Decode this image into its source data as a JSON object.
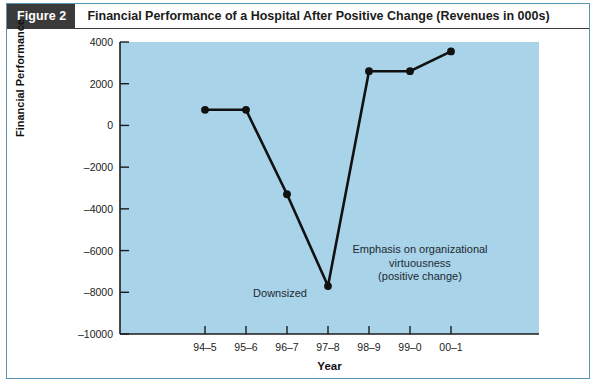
{
  "header": {
    "badge": "Figure 2",
    "title": "Financial Performance of a Hospital After Positive Change (Revenues in 000s)",
    "badge_bg": "#3a3a3a",
    "badge_text_color": "#ffffff"
  },
  "frame": {
    "border_color": "#5b93b5",
    "background": "#ffffff"
  },
  "chart_data": {
    "type": "line",
    "title": "Financial Performance of a Hospital After Positive Change (Revenues in 000s)",
    "xlabel": "Year",
    "ylabel": "Financial Performance",
    "categories": [
      "94–5",
      "95–6",
      "96–7",
      "97–8",
      "98–9",
      "99–0",
      "00–1"
    ],
    "values": [
      750,
      750,
      -3300,
      -7700,
      2600,
      2600,
      3550
    ],
    "ylim": [
      -10000,
      4000
    ],
    "yticks": [
      4000,
      2000,
      0,
      -2000,
      -4000,
      -6000,
      -8000,
      -10000
    ],
    "ytick_labels": [
      "4000",
      "2000",
      "0",
      "–2000",
      "–4000",
      "–6000",
      "–8000",
      "–10000"
    ],
    "grid": false,
    "legend": "none",
    "plot_background": "#a9d3e8",
    "line_color": "#111111",
    "marker_color": "#111111",
    "marker_shape": "circle",
    "annotations": [
      {
        "name": "downsized",
        "lines": [
          "Downsized"
        ],
        "points_to_category": "97–8"
      },
      {
        "name": "virtuousness",
        "lines": [
          "Emphasis on organizational",
          "virtuousness",
          "(positive change)"
        ],
        "points_to_category": "98–9"
      }
    ]
  }
}
